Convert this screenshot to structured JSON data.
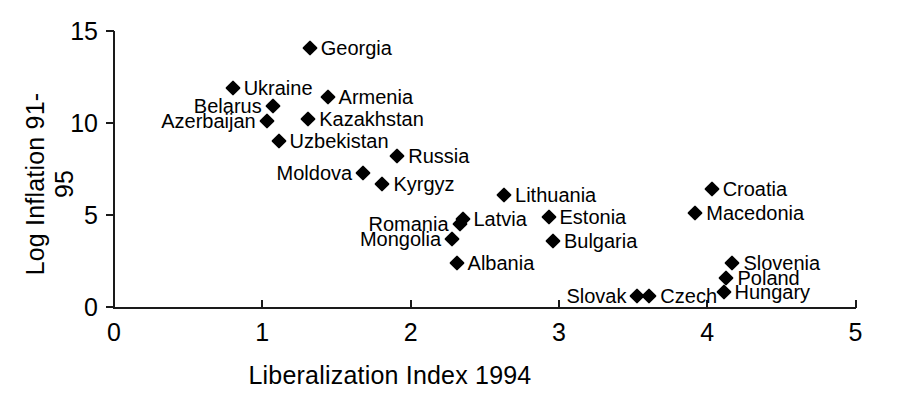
{
  "chart_data": {
    "type": "scatter",
    "title": "",
    "xlabel": "Liberalization Index 1994",
    "ylabel": "Log Inflation 91-95",
    "xlim": [
      0,
      5
    ],
    "ylim": [
      0,
      15
    ],
    "xticks": [
      "0",
      "1",
      "2",
      "3",
      "4",
      "5"
    ],
    "yticks": [
      "0",
      "5",
      "10",
      "15"
    ],
    "grid": false,
    "legend": "none",
    "marker": "diamond",
    "marker_color": "#000000",
    "points": [
      {
        "label": "Georgia",
        "x": 1.32,
        "y": 14.1,
        "label_side": "right"
      },
      {
        "label": "Ukraine",
        "x": 0.8,
        "y": 11.9,
        "label_side": "right"
      },
      {
        "label": "Armenia",
        "x": 1.44,
        "y": 11.4,
        "label_side": "right"
      },
      {
        "label": "Belarus",
        "x": 1.07,
        "y": 10.9,
        "label_side": "left"
      },
      {
        "label": "Azerbaijan",
        "x": 1.03,
        "y": 10.1,
        "label_side": "left"
      },
      {
        "label": "Kazakhstan",
        "x": 1.31,
        "y": 10.2,
        "label_side": "right"
      },
      {
        "label": "Uzbekistan",
        "x": 1.11,
        "y": 9.0,
        "label_side": "right"
      },
      {
        "label": "Russia",
        "x": 1.91,
        "y": 8.2,
        "label_side": "right"
      },
      {
        "label": "Moldova",
        "x": 1.68,
        "y": 7.3,
        "label_side": "left"
      },
      {
        "label": "Kyrgyz",
        "x": 1.81,
        "y": 6.7,
        "label_side": "right"
      },
      {
        "label": "Lithuania",
        "x": 2.63,
        "y": 6.1,
        "label_side": "right"
      },
      {
        "label": "Croatia",
        "x": 4.03,
        "y": 6.4,
        "label_side": "right"
      },
      {
        "label": "Macedonia",
        "x": 3.92,
        "y": 5.1,
        "label_side": "right"
      },
      {
        "label": "Estonia",
        "x": 2.93,
        "y": 4.9,
        "label_side": "right"
      },
      {
        "label": "Latvia",
        "x": 2.35,
        "y": 4.8,
        "label_side": "right"
      },
      {
        "label": "Romania",
        "x": 2.33,
        "y": 4.5,
        "label_side": "left"
      },
      {
        "label": "Mongolia",
        "x": 2.28,
        "y": 3.7,
        "label_side": "left"
      },
      {
        "label": "Bulgaria",
        "x": 2.96,
        "y": 3.6,
        "label_side": "right"
      },
      {
        "label": "Albania",
        "x": 2.31,
        "y": 2.4,
        "label_side": "right"
      },
      {
        "label": "Slovenia",
        "x": 4.17,
        "y": 2.4,
        "label_side": "right"
      },
      {
        "label": "Poland",
        "x": 4.13,
        "y": 1.6,
        "label_side": "right"
      },
      {
        "label": "Hungary",
        "x": 4.11,
        "y": 0.8,
        "label_side": "right"
      },
      {
        "label": "Slovak",
        "x": 3.53,
        "y": 0.6,
        "label_side": "left"
      },
      {
        "label": "Czech",
        "x": 3.61,
        "y": 0.6,
        "label_side": "right"
      }
    ]
  }
}
